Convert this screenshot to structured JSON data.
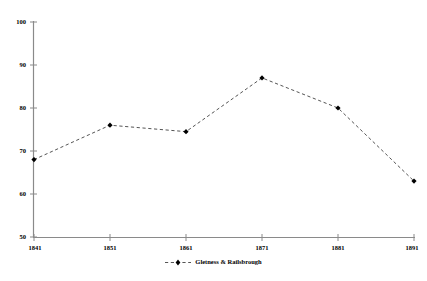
{
  "chart_data": {
    "type": "line",
    "title": "",
    "subtitle": "",
    "xlabel": "",
    "ylabel": "",
    "categories": [
      "1841",
      "1851",
      "1861",
      "1871",
      "1881",
      "1891"
    ],
    "x": [
      1841,
      1851,
      1861,
      1871,
      1881,
      1891
    ],
    "xlim": [
      1841,
      1891
    ],
    "ylim": [
      50,
      100
    ],
    "y_ticks": [
      "50",
      "60",
      "70",
      "80",
      "90",
      "100"
    ],
    "y_tick_values": [
      50,
      60,
      70,
      80,
      90,
      100
    ],
    "x_ticks": [
      "1841",
      "1851",
      "1861",
      "1871",
      "1881",
      "1891"
    ],
    "grid": false,
    "legend_position": "bottom",
    "series": [
      {
        "name": "Gletness & Railsbrough",
        "values": [
          68,
          76,
          74.5,
          87,
          80,
          63
        ],
        "line_style": "dashed",
        "line_color": "#555555",
        "marker": "diamond",
        "marker_color": "#000000"
      }
    ]
  },
  "legend": {
    "entry_label": "Gletness & Railsbrough"
  },
  "colors": {
    "axis": "#8a8a8a",
    "line": "#555555",
    "marker": "#000000",
    "text": "#000000",
    "background": "#ffffff"
  }
}
